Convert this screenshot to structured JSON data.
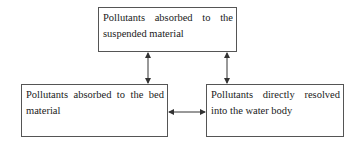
{
  "diagram": {
    "type": "flow",
    "nodes": [
      {
        "id": "suspended",
        "label": "Pollutants absorbed to the suspended material"
      },
      {
        "id": "bed",
        "label": "Pollutants absorbed to the bed material"
      },
      {
        "id": "water",
        "label": "Pollutants directly resolved into the water body"
      }
    ],
    "edges": [
      {
        "from": "suspended",
        "to": "bed",
        "direction": "bidirectional"
      },
      {
        "from": "suspended",
        "to": "water",
        "direction": "bidirectional"
      },
      {
        "from": "bed",
        "to": "water",
        "direction": "bidirectional"
      }
    ],
    "colors": {
      "border": "#555555",
      "arrow": "#333333",
      "text": "#1a1a1a",
      "background": "#ffffff"
    }
  }
}
